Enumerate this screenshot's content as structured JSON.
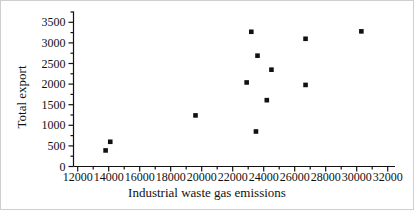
{
  "figure": {
    "background": "#ffffff",
    "ink_color": "#111111",
    "border_color": "#cfcfcf"
  },
  "chart_data": {
    "type": "scatter",
    "title": "",
    "xlabel": "Industrial waste gas emissions",
    "ylabel": "Total export",
    "xlim": [
      11700,
      32500
    ],
    "ylim": [
      0,
      3750
    ],
    "x_ticks": [
      12000,
      14000,
      16000,
      18000,
      20000,
      22000,
      24000,
      26000,
      28000,
      30000,
      32000
    ],
    "y_ticks": [
      0,
      500,
      1000,
      1500,
      2000,
      2500,
      3000,
      3500
    ],
    "x_minor_step": 1000,
    "y_minor_step": 250,
    "grid": false,
    "legend": null,
    "marker": "filled-black-square",
    "points": [
      [
        13800,
        390
      ],
      [
        14100,
        600
      ],
      [
        19600,
        1240
      ],
      [
        22900,
        2040
      ],
      [
        23200,
        3270
      ],
      [
        23500,
        850
      ],
      [
        23600,
        2690
      ],
      [
        24200,
        1610
      ],
      [
        24500,
        2350
      ],
      [
        26700,
        3100
      ],
      [
        26700,
        1980
      ],
      [
        30300,
        3280
      ]
    ]
  }
}
